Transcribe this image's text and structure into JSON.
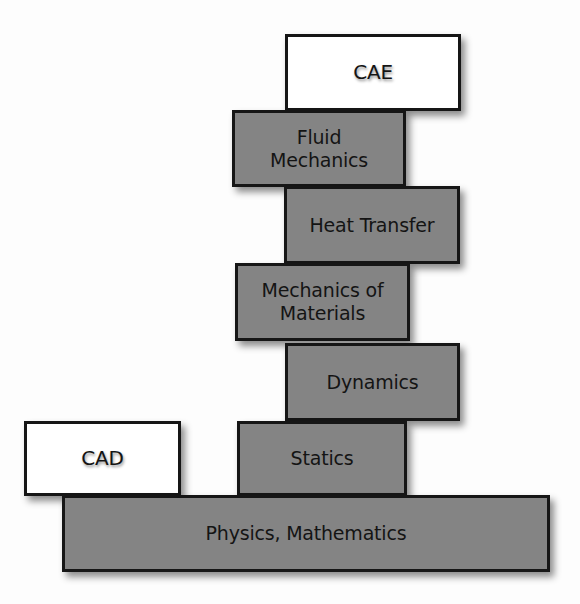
{
  "diagram": {
    "type": "stacked-blocks",
    "colors": {
      "filled_block": "#8f8f8f",
      "outline_block": "#ffffff",
      "border": "#161616",
      "text": "#141414"
    },
    "blocks": [
      {
        "id": "cae",
        "label": "CAE",
        "style": "outline",
        "x": 285,
        "y": 34,
        "w": 176,
        "h": 77
      },
      {
        "id": "fluid-mechanics",
        "label": "Fluid\nMechanics",
        "style": "filled",
        "x": 232,
        "y": 110,
        "w": 174,
        "h": 77
      },
      {
        "id": "heat-transfer",
        "label": "Heat Transfer",
        "style": "filled",
        "x": 284,
        "y": 186,
        "w": 176,
        "h": 78
      },
      {
        "id": "mechanics-of-materials",
        "label": "Mechanics of\nMaterials",
        "style": "filled",
        "x": 235,
        "y": 263,
        "w": 175,
        "h": 78
      },
      {
        "id": "dynamics",
        "label": "Dynamics",
        "style": "filled",
        "x": 285,
        "y": 343,
        "w": 175,
        "h": 78
      },
      {
        "id": "cad",
        "label": "CAD",
        "style": "outline",
        "x": 24,
        "y": 421,
        "w": 157,
        "h": 75
      },
      {
        "id": "statics",
        "label": "Statics",
        "style": "filled",
        "x": 237,
        "y": 421,
        "w": 170,
        "h": 75
      },
      {
        "id": "physics-mathematics",
        "label": "Physics, Mathematics",
        "style": "filled",
        "x": 62,
        "y": 495,
        "w": 488,
        "h": 77
      }
    ]
  }
}
